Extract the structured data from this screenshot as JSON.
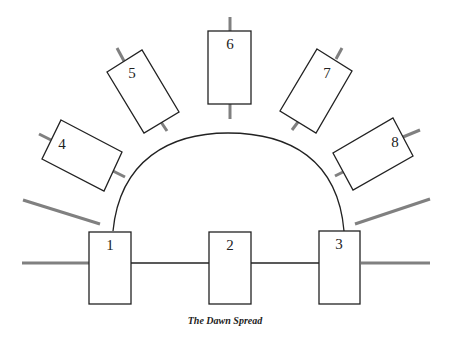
{
  "title": "The Dawn Spread",
  "colors": {
    "card_stroke": "#222222",
    "stub_color": "#808080",
    "background": "#ffffff"
  },
  "cards": [
    {
      "label": "1",
      "position": "bottom-left"
    },
    {
      "label": "2",
      "position": "bottom-center"
    },
    {
      "label": "3",
      "position": "bottom-right"
    },
    {
      "label": "4",
      "position": "arc-left-low"
    },
    {
      "label": "5",
      "position": "arc-left-high"
    },
    {
      "label": "6",
      "position": "arc-top"
    },
    {
      "label": "7",
      "position": "arc-right-high"
    },
    {
      "label": "8",
      "position": "arc-right-low"
    }
  ]
}
